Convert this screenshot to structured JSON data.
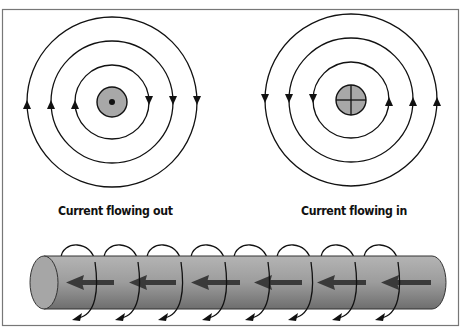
{
  "diagram": {
    "type": "magnetic-field-around-current-carrying-conductor",
    "left_panel": {
      "label": "Current flowing out",
      "conductor_symbol": "dot",
      "field_direction": "counterclockwise",
      "field_lines": 3
    },
    "right_panel": {
      "label": "Current flowing in",
      "conductor_symbol": "cross",
      "field_direction": "clockwise",
      "field_lines": 3
    },
    "bottom_panel": {
      "object": "cylindrical-conductor",
      "current_arrows": 8,
      "current_direction": "left",
      "field_loops": 8
    },
    "colors": {
      "line": "#111111",
      "conductor_fill": "#a8a8a8",
      "cylinder_fill": "#9a9a9a",
      "arrow_fill": "#3a3a3a"
    }
  }
}
